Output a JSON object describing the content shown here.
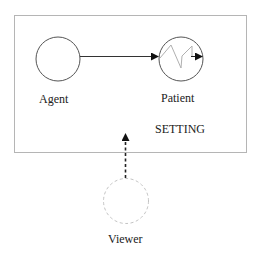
{
  "diagram": {
    "setting": {
      "label": "SETTING",
      "border_color": "#b5b5b5"
    },
    "agent": {
      "label": "Agent",
      "stroke": "#555555"
    },
    "patient": {
      "label": "Patient",
      "stroke": "#555555",
      "squiggle_color": "#b0b0b0"
    },
    "viewer": {
      "label": "Viewer",
      "stroke": "#c4c4c4",
      "style": "dashed"
    },
    "edges": [
      {
        "from": "Agent",
        "to": "Patient",
        "style": "solid"
      },
      {
        "from": "Viewer",
        "to": "Setting",
        "style": "dashed"
      }
    ]
  }
}
